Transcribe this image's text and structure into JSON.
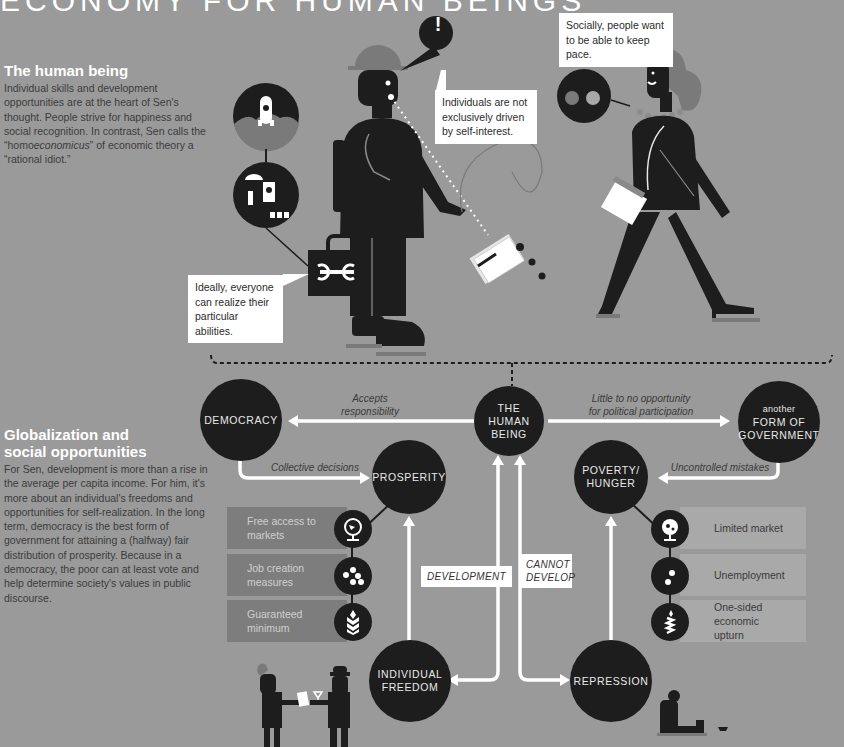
{
  "header": {
    "title": "ECONOMY FOR HUMAN BEINGS"
  },
  "sections": [
    {
      "heading": "The human being",
      "text_before_em": "Individual skills and development opportunities are at the heart of Sen's thought. People strive for happiness and social recognition. In contrast, Sen calls the “homo",
      "text_em": "economicus",
      "text_after_em": "” of economic theory a “rational idiot.”"
    },
    {
      "heading_line1": "Globalization and",
      "heading_line2": "social opportunities",
      "text": "For Sen, development is more than a rise in the average per capita income. For him, it's more about an individual's freedoms and opportunities for self-realization. In the long term, democracy is the best form of government for attaining a (halfway) fair distribution of prosperity. Because in a democracy, the poor can at least vote and help determine society's values in public discourse."
    }
  ],
  "callouts": {
    "self_interest": "Individuals are not exclusively driven by self-interest.",
    "keep_pace": "Socially, people want to be able to keep pace.",
    "abilities": "Ideally, everyone can realize their particular abilities.",
    "exclamation": "!"
  },
  "nodes": {
    "human_being": [
      "THE",
      "HUMAN",
      "BEING"
    ],
    "democracy": "DEMOCRACY",
    "other_government_small": "another",
    "other_government": [
      "FORM OF",
      "GOVERNMENT"
    ],
    "prosperity": "PROSPERITY",
    "poverty": [
      "POVERTY/",
      "HUNGER"
    ],
    "freedom": [
      "INDIVIDUAL",
      "FREEDOM"
    ],
    "repression": "REPRESSION"
  },
  "edges": {
    "accepts_responsibility": [
      "Accepts",
      "responsibility"
    ],
    "little_opportunity": [
      "Little to no opportunity",
      "for political participation"
    ],
    "collective_decisions": "Collective decisions",
    "uncontrolled_mistakes": "Uncontrolled mistakes",
    "development": "DEVELOPMENT",
    "cannot_develop": [
      "CANNOT",
      "DEVELOP"
    ]
  },
  "prosperity_factors": [
    {
      "label": [
        "Free access to",
        "markets"
      ],
      "icon": "globe-icon"
    },
    {
      "label": [
        "Job creation",
        "measures"
      ],
      "icon": "dots-icon"
    },
    {
      "label": [
        "Guaranteed",
        "minimum"
      ],
      "icon": "wheat-icon"
    }
  ],
  "poverty_factors": [
    {
      "label": [
        "Limited market"
      ],
      "icon": "globe-icon"
    },
    {
      "label": [
        "Unemployment"
      ],
      "icon": "dots-icon"
    },
    {
      "label": [
        "One-sided economic",
        "upturn"
      ],
      "icon": "wheat-icon"
    }
  ],
  "colors": {
    "background": "#9a9a9a",
    "node": "#1d1d1d",
    "left_panel": "#7d7d7d",
    "right_panel": "#a9a9a9",
    "arrow": "#ffffff",
    "hat": "#7a7a7a"
  }
}
